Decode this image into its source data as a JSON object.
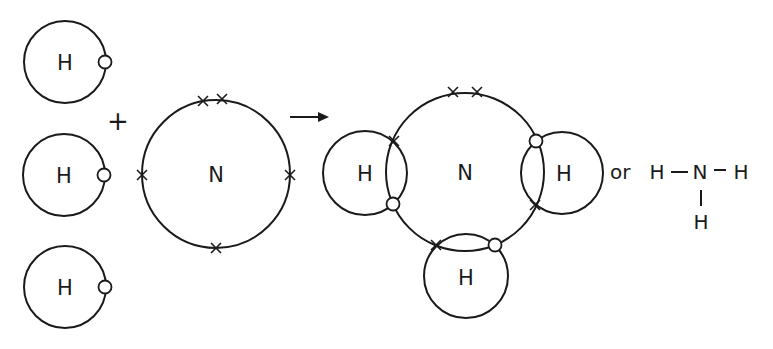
{
  "reactants": {
    "hydrogen_atoms": [
      {
        "label": "H",
        "electrons": 1,
        "electron_symbol": "circle"
      },
      {
        "label": "H",
        "electrons": 1,
        "electron_symbol": "circle"
      },
      {
        "label": "H",
        "electrons": 1,
        "electron_symbol": "circle"
      }
    ],
    "plus_sign": "+",
    "nitrogen_atom": {
      "label": "N",
      "outer_electrons": 5,
      "electron_symbol": "cross"
    }
  },
  "arrow": "reaction-arrow",
  "product": {
    "center_label": "N",
    "hydrogen_labels": [
      "H",
      "H",
      "H"
    ],
    "lone_pair_electrons": 2,
    "shared_pairs": 3
  },
  "or_label": "or",
  "structural_formula": {
    "atoms": [
      "H",
      "N",
      "H",
      "H"
    ],
    "bond": "–"
  },
  "colors": {
    "line": "#1a1a1a",
    "background": "#ffffff"
  }
}
